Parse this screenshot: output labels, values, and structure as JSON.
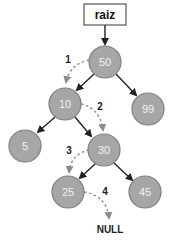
{
  "root_label": "raiz",
  "nodes": [
    {
      "id": "n50",
      "label": "50",
      "cx": 105,
      "cy": 62
    },
    {
      "id": "n10",
      "label": "10",
      "cx": 65,
      "cy": 104
    },
    {
      "id": "n99",
      "label": "99",
      "cx": 148,
      "cy": 109
    },
    {
      "id": "n5",
      "label": "5",
      "cx": 25,
      "cy": 146
    },
    {
      "id": "n30",
      "label": "30",
      "cx": 104,
      "cy": 150
    },
    {
      "id": "n25",
      "label": "25",
      "cx": 68,
      "cy": 192
    },
    {
      "id": "n45",
      "label": "45",
      "cx": 145,
      "cy": 192
    }
  ],
  "steps": [
    "1",
    "2",
    "3",
    "4"
  ],
  "null_label": "NULL",
  "colors": {
    "node_fill": "#a6a6a6",
    "node_stroke": "#7f7f7f",
    "edge": "#222222",
    "dashed": "#8c8c8c"
  }
}
